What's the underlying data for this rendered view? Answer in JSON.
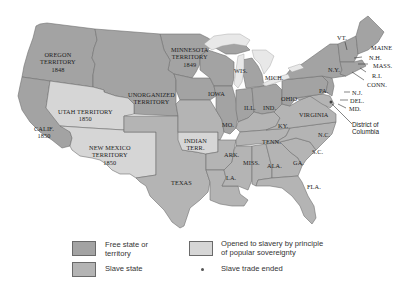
{
  "colors": {
    "free": "#a3a3a3",
    "slave": "#b4b4b4",
    "popular_sovereignty": "#d6d6d6",
    "water": "#e8e8e8",
    "border": "#707070",
    "background": "#ffffff"
  },
  "regions": {
    "oregon": {
      "name": "OREGON",
      "line2": "TERRITORY",
      "year": "1848"
    },
    "minnesota": {
      "name": "MINNESOTA",
      "line2": "TERRITORY",
      "year": "1849"
    },
    "unorganized": {
      "name": "UNORGANIZED",
      "line2": "TERRITORY"
    },
    "utah": {
      "name": "UTAH TERRITORY",
      "year": "1850"
    },
    "calif": {
      "name": "CALIF.",
      "year": "1850"
    },
    "new_mexico": {
      "name": "NEW MEXICO",
      "line2": "TERRITORY",
      "year": "1850"
    },
    "indian": {
      "name": "INDIAN",
      "line2": "TERR."
    },
    "texas": {
      "name": "TEXAS"
    },
    "wis": {
      "name": "WIS."
    },
    "mich": {
      "name": "MICH."
    },
    "iowa": {
      "name": "IOWA"
    },
    "ill": {
      "name": "ILL."
    },
    "ind": {
      "name": "IND."
    },
    "ohio": {
      "name": "OHIO"
    },
    "mo": {
      "name": "MO."
    },
    "ky": {
      "name": "KY."
    },
    "tenn": {
      "name": "TENN."
    },
    "ark": {
      "name": "ARK."
    },
    "miss": {
      "name": "MISS."
    },
    "ala": {
      "name": "ALA."
    },
    "ga": {
      "name": "GA."
    },
    "la": {
      "name": "LA."
    },
    "fla": {
      "name": "FLA."
    },
    "sc": {
      "name": "S.C."
    },
    "nc": {
      "name": "N.C."
    },
    "virginia": {
      "name": "VIRGINIA"
    },
    "pa": {
      "name": "PA."
    },
    "ny": {
      "name": "N.Y."
    },
    "vt": {
      "name": "VT."
    },
    "maine": {
      "name": "MAINE"
    },
    "nh": {
      "name": "N.H."
    },
    "mass": {
      "name": "MASS."
    },
    "ri": {
      "name": "R.I."
    },
    "conn": {
      "name": "CONN."
    },
    "nj": {
      "name": "N.J."
    },
    "del": {
      "name": "DEL."
    },
    "md": {
      "name": "MD."
    },
    "dc": {
      "line1": "District of",
      "line2": "Columbia"
    }
  },
  "legend": {
    "free": {
      "line1": "Free state or",
      "line2": "territory"
    },
    "slave": {
      "label": "Slave state"
    },
    "popular": {
      "line1": "Opened to slavery by principle",
      "line2": "of popular sovereignty"
    },
    "trade": {
      "label": "Slave trade ended"
    }
  }
}
